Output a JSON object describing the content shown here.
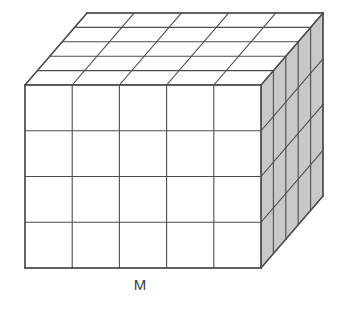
{
  "figure": {
    "type": "diagram",
    "background_color": "#ffffff"
  },
  "geometry": {
    "front_face": {
      "origin_x": 25,
      "origin_y": 85,
      "width": 236,
      "height": 183,
      "columns": 5,
      "rows": 4,
      "fill_color": "#ffffff"
    },
    "depth": {
      "slices": 5,
      "offset_x": 62,
      "offset_y": -72
    },
    "top_face": {
      "fill_color": "#ffffff",
      "columns": 5,
      "slices": 5
    },
    "right_face": {
      "fill_color": "#c8c8c8",
      "slices": 5,
      "rows": 4
    },
    "stroke": {
      "color": "#4d4d4d",
      "width": 1.1,
      "outline_width": 1.4
    }
  },
  "labels": {
    "bottom": {
      "text": "M",
      "x": 140,
      "y": 286,
      "font_size": 15,
      "color": "#3a3a3a"
    }
  },
  "chart_data": {
    "type": "diagram",
    "title": "",
    "annotations": [
      "M"
    ],
    "counts": {
      "width_cells": 5,
      "height_cells": 4,
      "depth_cells": 5,
      "total_cells": 100
    }
  }
}
